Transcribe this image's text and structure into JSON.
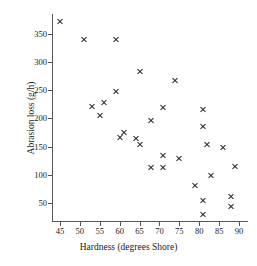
{
  "chart_data": {
    "type": "scatter",
    "title": "",
    "xlabel": "Hardness (degrees Shore)",
    "ylabel": "Abrasion loss (g/h)",
    "xlim": [
      43,
      92
    ],
    "ylim": [
      18,
      385
    ],
    "xticks": [
      45,
      50,
      55,
      60,
      65,
      70,
      75,
      80,
      85,
      90
    ],
    "yticks": [
      50,
      100,
      150,
      200,
      250,
      300,
      350
    ],
    "grid": false,
    "legend": "none",
    "marker": "x",
    "marker_color": "#2b2b2b",
    "series": [
      {
        "name": "rubber specimens",
        "x": [
          45,
          51,
          53,
          55,
          56,
          59,
          59,
          60,
          61,
          64,
          65,
          65,
          68,
          68,
          71,
          71,
          71,
          74,
          75,
          79,
          81,
          81,
          81,
          81,
          82,
          83,
          86,
          88,
          88,
          89
        ],
        "y": [
          372,
          340,
          221,
          205,
          228,
          248,
          339,
          166,
          175,
          164,
          153,
          283,
          113,
          196,
          113,
          135,
          219,
          267,
          129,
          81,
          30,
          54,
          186,
          215,
          154,
          98,
          148,
          44,
          62,
          114
        ]
      }
    ],
    "points": [
      {
        "x": 45,
        "y": 372
      },
      {
        "x": 51,
        "y": 340
      },
      {
        "x": 53,
        "y": 221
      },
      {
        "x": 55,
        "y": 205
      },
      {
        "x": 56,
        "y": 228
      },
      {
        "x": 59,
        "y": 248
      },
      {
        "x": 59,
        "y": 339
      },
      {
        "x": 60,
        "y": 166
      },
      {
        "x": 61,
        "y": 175
      },
      {
        "x": 64,
        "y": 164
      },
      {
        "x": 65,
        "y": 153
      },
      {
        "x": 65,
        "y": 283
      },
      {
        "x": 68,
        "y": 113
      },
      {
        "x": 68,
        "y": 196
      },
      {
        "x": 71,
        "y": 113
      },
      {
        "x": 71,
        "y": 135
      },
      {
        "x": 71,
        "y": 219
      },
      {
        "x": 74,
        "y": 267
      },
      {
        "x": 75,
        "y": 129
      },
      {
        "x": 79,
        "y": 81
      },
      {
        "x": 81,
        "y": 30
      },
      {
        "x": 81,
        "y": 54
      },
      {
        "x": 81,
        "y": 186
      },
      {
        "x": 81,
        "y": 215
      },
      {
        "x": 82,
        "y": 154
      },
      {
        "x": 83,
        "y": 98
      },
      {
        "x": 86,
        "y": 148
      },
      {
        "x": 88,
        "y": 44
      },
      {
        "x": 88,
        "y": 62
      },
      {
        "x": 89,
        "y": 114
      }
    ]
  }
}
